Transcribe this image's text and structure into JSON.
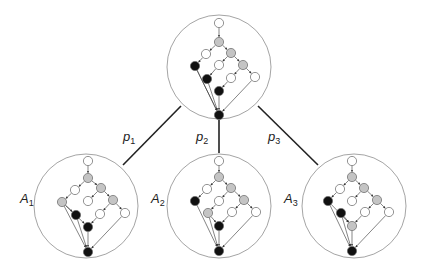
{
  "colors": {
    "white": "#ffffff",
    "gray": "#c4c4c4",
    "black": "#111111",
    "stroke": "#666666",
    "circle": "#9a9a9a",
    "edge": "#333333"
  },
  "labels": {
    "p1": {
      "base": "p",
      "sub": "1",
      "x": 123,
      "y": 130
    },
    "p2": {
      "base": "p",
      "sub": "2",
      "x": 196,
      "y": 130
    },
    "p3": {
      "base": "p",
      "sub": "3",
      "x": 268,
      "y": 130
    },
    "A1": {
      "base": "A",
      "sub": "1",
      "x": 20,
      "y": 192
    },
    "A2": {
      "base": "A",
      "sub": "2",
      "x": 151,
      "y": 192
    },
    "A3": {
      "base": "A",
      "sub": "3",
      "x": 284,
      "y": 192
    }
  },
  "connectors": [
    {
      "id": "p1",
      "x1": 181,
      "y1": 106,
      "x2": 123,
      "y2": 165
    },
    {
      "id": "p2",
      "x1": 219,
      "y1": 120,
      "x2": 219,
      "y2": 153
    },
    {
      "id": "p3",
      "x1": 258,
      "y1": 106,
      "x2": 318,
      "y2": 165
    }
  ],
  "graphs": [
    {
      "id": "root",
      "circle": {
        "cx": 219,
        "cy": 67,
        "r": 52
      },
      "nodes": [
        {
          "x": 219,
          "y": 23,
          "c": "white"
        },
        {
          "x": 219,
          "y": 42,
          "c": "gray"
        },
        {
          "x": 206,
          "y": 54,
          "c": "white"
        },
        {
          "x": 231,
          "y": 53,
          "c": "gray"
        },
        {
          "x": 195,
          "y": 66,
          "c": "black"
        },
        {
          "x": 219,
          "y": 65,
          "c": "white"
        },
        {
          "x": 243,
          "y": 65,
          "c": "gray"
        },
        {
          "x": 207,
          "y": 79,
          "c": "black"
        },
        {
          "x": 231,
          "y": 78,
          "c": "white"
        },
        {
          "x": 255,
          "y": 77,
          "c": "white"
        },
        {
          "x": 219,
          "y": 91,
          "c": "black"
        },
        {
          "x": 219,
          "y": 115,
          "c": "black"
        }
      ],
      "edges": [
        [
          0,
          1
        ],
        [
          1,
          2
        ],
        [
          1,
          3
        ],
        [
          2,
          4
        ],
        [
          3,
          5
        ],
        [
          3,
          6
        ],
        [
          5,
          7
        ],
        [
          6,
          8
        ],
        [
          6,
          9
        ],
        [
          8,
          10
        ],
        [
          4,
          11
        ],
        [
          7,
          11
        ],
        [
          10,
          11
        ],
        [
          9,
          11
        ],
        [
          4,
          11
        ]
      ]
    },
    {
      "id": "A1",
      "circle": {
        "cx": 86,
        "cy": 206,
        "r": 52
      },
      "nodes": [
        {
          "x": 88,
          "y": 161,
          "c": "white"
        },
        {
          "x": 88,
          "y": 178,
          "c": "gray"
        },
        {
          "x": 75,
          "y": 190,
          "c": "white"
        },
        {
          "x": 101,
          "y": 188,
          "c": "gray"
        },
        {
          "x": 62,
          "y": 202,
          "c": "gray"
        },
        {
          "x": 88,
          "y": 201,
          "c": "white"
        },
        {
          "x": 113,
          "y": 200,
          "c": "gray"
        },
        {
          "x": 76,
          "y": 215,
          "c": "black"
        },
        {
          "x": 100,
          "y": 214,
          "c": "white"
        },
        {
          "x": 125,
          "y": 213,
          "c": "white"
        },
        {
          "x": 88,
          "y": 227,
          "c": "black"
        },
        {
          "x": 88,
          "y": 252,
          "c": "black"
        }
      ],
      "edges": [
        [
          0,
          1
        ],
        [
          1,
          2
        ],
        [
          1,
          3
        ],
        [
          2,
          4
        ],
        [
          3,
          5
        ],
        [
          3,
          6
        ],
        [
          4,
          7
        ],
        [
          6,
          8
        ],
        [
          6,
          9
        ],
        [
          8,
          10
        ],
        [
          4,
          11
        ],
        [
          7,
          11
        ],
        [
          10,
          11
        ],
        [
          9,
          11
        ],
        [
          4,
          10
        ]
      ]
    },
    {
      "id": "A2",
      "circle": {
        "cx": 219,
        "cy": 206,
        "r": 52
      },
      "nodes": [
        {
          "x": 219,
          "y": 161,
          "c": "white"
        },
        {
          "x": 219,
          "y": 177,
          "c": "gray"
        },
        {
          "x": 207,
          "y": 189,
          "c": "white"
        },
        {
          "x": 231,
          "y": 188,
          "c": "gray"
        },
        {
          "x": 195,
          "y": 201,
          "c": "black"
        },
        {
          "x": 219,
          "y": 201,
          "c": "white"
        },
        {
          "x": 244,
          "y": 200,
          "c": "gray"
        },
        {
          "x": 208,
          "y": 213,
          "c": "gray"
        },
        {
          "x": 232,
          "y": 212,
          "c": "white"
        },
        {
          "x": 256,
          "y": 212,
          "c": "white"
        },
        {
          "x": 219,
          "y": 226,
          "c": "black"
        },
        {
          "x": 219,
          "y": 251,
          "c": "black"
        }
      ],
      "edges": [
        [
          0,
          1
        ],
        [
          1,
          2
        ],
        [
          1,
          3
        ],
        [
          2,
          4
        ],
        [
          3,
          5
        ],
        [
          3,
          6
        ],
        [
          5,
          7
        ],
        [
          6,
          8
        ],
        [
          6,
          9
        ],
        [
          8,
          10
        ],
        [
          7,
          10
        ],
        [
          4,
          11
        ],
        [
          7,
          11
        ],
        [
          10,
          11
        ],
        [
          9,
          11
        ]
      ]
    },
    {
      "id": "A3",
      "circle": {
        "cx": 354,
        "cy": 206,
        "r": 52
      },
      "nodes": [
        {
          "x": 352,
          "y": 161,
          "c": "white"
        },
        {
          "x": 352,
          "y": 177,
          "c": "gray"
        },
        {
          "x": 340,
          "y": 189,
          "c": "white"
        },
        {
          "x": 364,
          "y": 188,
          "c": "gray"
        },
        {
          "x": 328,
          "y": 201,
          "c": "black"
        },
        {
          "x": 352,
          "y": 201,
          "c": "white"
        },
        {
          "x": 377,
          "y": 200,
          "c": "gray"
        },
        {
          "x": 341,
          "y": 213,
          "c": "black"
        },
        {
          "x": 365,
          "y": 212,
          "c": "white"
        },
        {
          "x": 389,
          "y": 212,
          "c": "white"
        },
        {
          "x": 352,
          "y": 226,
          "c": "gray"
        },
        {
          "x": 352,
          "y": 251,
          "c": "black"
        }
      ],
      "edges": [
        [
          0,
          1
        ],
        [
          1,
          2
        ],
        [
          1,
          3
        ],
        [
          2,
          4
        ],
        [
          3,
          5
        ],
        [
          3,
          6
        ],
        [
          4,
          10
        ],
        [
          7,
          10
        ],
        [
          6,
          8
        ],
        [
          6,
          9
        ],
        [
          8,
          10
        ],
        [
          4,
          11
        ],
        [
          7,
          11
        ],
        [
          10,
          11
        ],
        [
          9,
          11
        ]
      ]
    }
  ]
}
